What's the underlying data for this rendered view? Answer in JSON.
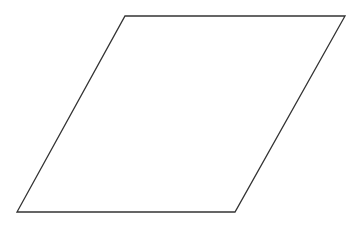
{
  "diagram": {
    "shape": "parallelogram",
    "stroke_color": "#333333",
    "fill_color": "#ffffff",
    "labels": []
  }
}
